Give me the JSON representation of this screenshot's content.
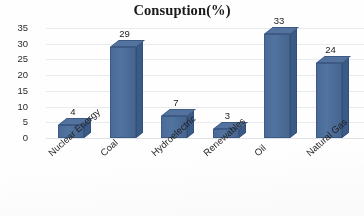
{
  "chart_data": {
    "type": "bar",
    "title": "Consuption(%)",
    "xlabel": "",
    "ylabel": "",
    "categories": [
      "Nuclear Energy",
      "Coal",
      "Hydroelectric",
      "Renewables",
      "Oil",
      "Natural Gas"
    ],
    "values": [
      4,
      29,
      7,
      3,
      33,
      24
    ],
    "data_labels": [
      "4",
      "29",
      "7",
      "3",
      "33",
      "24"
    ],
    "ylim": [
      0,
      35
    ],
    "ytick_values": [
      35,
      30,
      25,
      20,
      15,
      10,
      5,
      0
    ],
    "ytick_labels": [
      "35",
      "30",
      "25",
      "20",
      "15",
      "10",
      "5",
      "0"
    ],
    "grid": true,
    "legend": false,
    "style_3d": true,
    "bar_color": "#4a6b99",
    "bar_side_color": "#3b5b87",
    "grid_color": "#e9ecef"
  }
}
